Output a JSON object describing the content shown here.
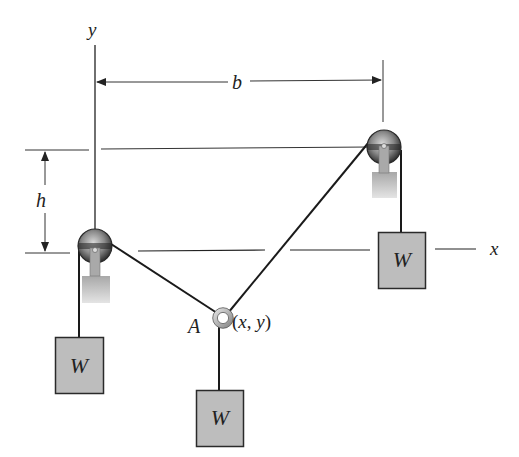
{
  "figure": {
    "type": "statics pulley diagram",
    "axes": {
      "x_label": "x",
      "y_label": "y"
    },
    "dimensions": {
      "horizontal": "b",
      "vertical": "h"
    },
    "point": {
      "name": "A",
      "coords_label": "(x, y)"
    },
    "weights": [
      {
        "id": "left",
        "label": "W"
      },
      {
        "id": "middle",
        "label": "W"
      },
      {
        "id": "right",
        "label": "W"
      }
    ],
    "pulleys": [
      {
        "id": "left",
        "position": "origin"
      },
      {
        "id": "right",
        "position": "(b, h)"
      }
    ],
    "colors": {
      "line": "#1a1a1a",
      "weight_fill": "#bdbdbd",
      "pulley_dark": "#3a3a3a",
      "support_fill": "#b5b5b5"
    }
  }
}
